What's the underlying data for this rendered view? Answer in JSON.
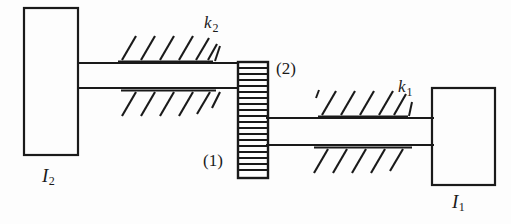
{
  "figure": {
    "background_color": "#fdfdfd",
    "ink_color": "#1a1a1a",
    "width": 511,
    "height": 224
  },
  "labels": {
    "inertia_left": {
      "symbol": "I",
      "subscript": "2",
      "name": "I2"
    },
    "inertia_right": {
      "symbol": "I",
      "subscript": "1",
      "name": "I1"
    },
    "stiffness_left": {
      "symbol": "k",
      "subscript": "2",
      "name": "k2"
    },
    "stiffness_right": {
      "symbol": "k",
      "subscript": "1",
      "name": "k1"
    },
    "gear_upper": "(2)",
    "gear_lower": "(1)"
  },
  "components": {
    "block_left": {
      "x": 24,
      "y": 8,
      "width": 54,
      "height": 147
    },
    "block_right": {
      "x": 432,
      "y": 88,
      "width": 63,
      "height": 97
    },
    "gear": {
      "x": 238,
      "y": 62,
      "width": 30,
      "height": 116,
      "tooth_pitch": 6
    },
    "shaft_left": {
      "x1": 78,
      "x2": 238,
      "y_top": 63,
      "y_bottom": 88
    },
    "shaft_right": {
      "x1": 268,
      "x2": 432,
      "y_top": 118,
      "y_bottom": 145
    },
    "hatch_left_upper": {
      "baseline_y": 62,
      "x_start": 118,
      "x_end": 212,
      "strokes": 6
    },
    "hatch_left_lower": {
      "baseline_y": 90,
      "x_start": 122,
      "x_end": 214,
      "strokes": 6
    },
    "hatch_right_upper": {
      "baseline_y": 117,
      "x_start": 318,
      "x_end": 408,
      "strokes": 6
    },
    "hatch_right_lower": {
      "baseline_y": 147,
      "x_start": 314,
      "x_end": 412,
      "strokes": 6
    }
  }
}
